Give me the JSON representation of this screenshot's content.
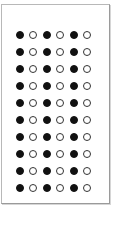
{
  "pattern": {
    "rows": 10,
    "columns": 6,
    "row_template": [
      "filled",
      "open",
      "filled",
      "open",
      "filled",
      "open"
    ],
    "colors": {
      "filled": "#111111",
      "open_border": "#333333",
      "background": "#ffffff",
      "frame_border": "#b8b8b8"
    }
  }
}
